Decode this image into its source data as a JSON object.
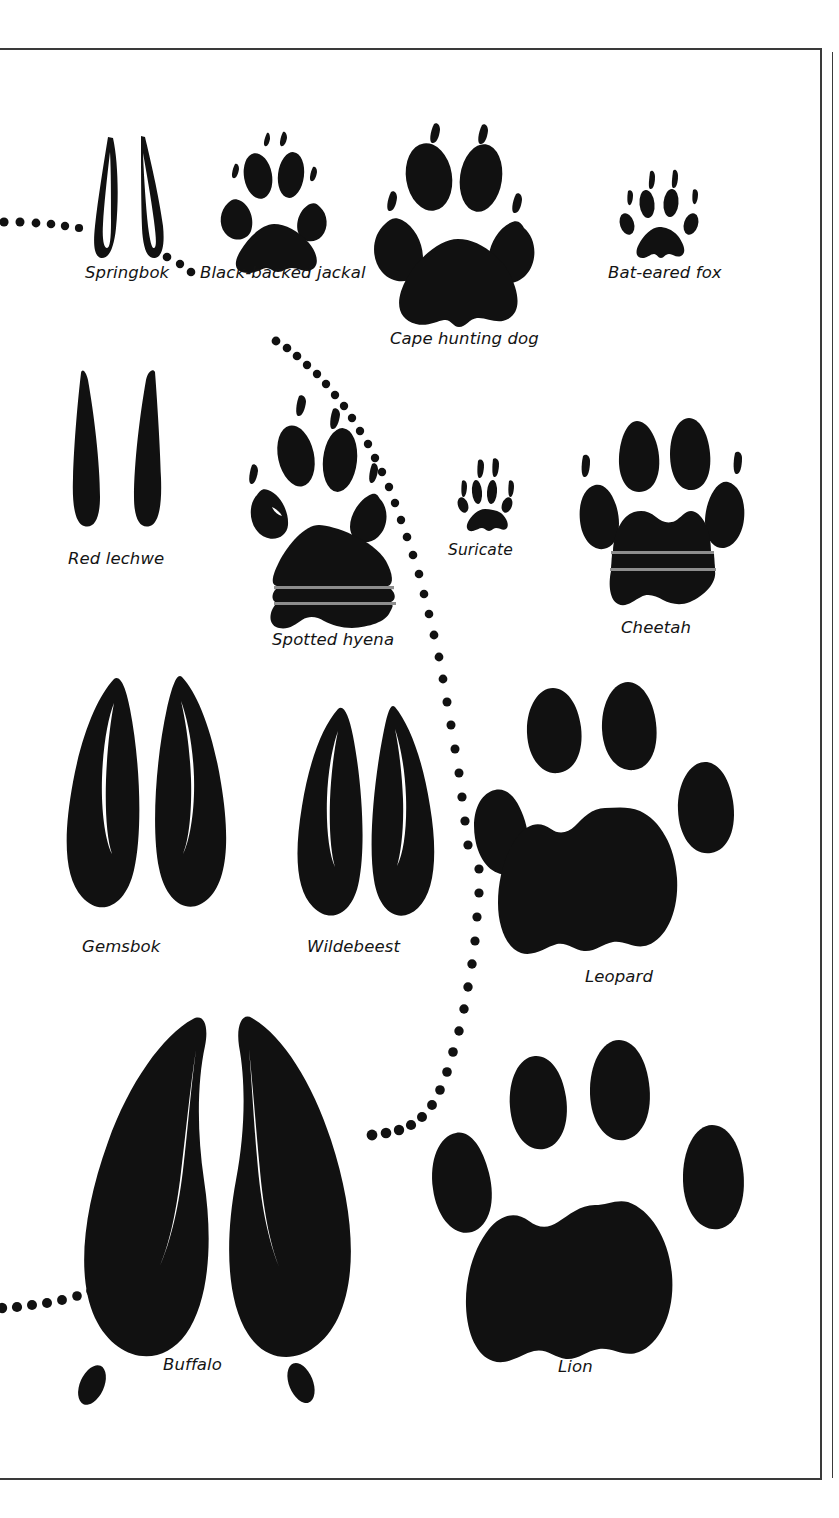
{
  "page": {
    "kind": "field-guide-plate",
    "background_color": "#ffffff",
    "ink_color": "#111111",
    "border_color": "#3a3a3a"
  },
  "tracks": [
    {
      "id": "springbok",
      "label": "Springbok",
      "type": "cloven-hoof",
      "label_x": 85,
      "label_y": 273
    },
    {
      "id": "black-backed-jackal",
      "label": "Black-backed jackal",
      "type": "paw-canid",
      "label_x": 200,
      "label_y": 273
    },
    {
      "id": "cape-hunting-dog",
      "label": "Cape hunting dog",
      "type": "paw-canid",
      "label_x": 390,
      "label_y": 339
    },
    {
      "id": "bat-eared-fox",
      "label": "Bat-eared fox",
      "type": "paw-canid",
      "label_x": 608,
      "label_y": 273
    },
    {
      "id": "red-lechwe",
      "label": "Red lechwe",
      "type": "cloven-hoof",
      "label_x": 68,
      "label_y": 559
    },
    {
      "id": "spotted-hyena",
      "label": "Spotted hyena",
      "type": "paw-canid",
      "label_x": 272,
      "label_y": 640
    },
    {
      "id": "suricate",
      "label": "Suricate",
      "type": "paw-small-mammal",
      "label_x": 448,
      "label_y": 550
    },
    {
      "id": "cheetah",
      "label": "Cheetah",
      "type": "paw-felid-clawed",
      "label_x": 621,
      "label_y": 628
    },
    {
      "id": "gemsbok",
      "label": "Gemsbok",
      "type": "cloven-hoof",
      "label_x": 82,
      "label_y": 947
    },
    {
      "id": "wildebeest",
      "label": "Wildebeest",
      "type": "cloven-hoof",
      "label_x": 307,
      "label_y": 947
    },
    {
      "id": "leopard",
      "label": "Leopard",
      "type": "paw-felid",
      "label_x": 585,
      "label_y": 977
    },
    {
      "id": "buffalo",
      "label": "Buffalo",
      "type": "cloven-hoof",
      "label_x": 163,
      "label_y": 1365
    },
    {
      "id": "lion",
      "label": "Lion",
      "type": "paw-felid",
      "label_x": 558,
      "label_y": 1367
    }
  ],
  "trails": [
    {
      "id": "trail-springbok-left",
      "description": "dotted trail entering from left edge toward Springbok"
    },
    {
      "id": "trail-springbok-right",
      "description": "dotted trail from Springbok toward Black-backed jackal"
    },
    {
      "id": "trail-main-arc",
      "description": "long dotted arc sweeping from upper-centre down past Suricate and Leopard to Buffalo"
    },
    {
      "id": "trail-buffalo-left",
      "description": "dotted trail entering from left edge toward Buffalo"
    }
  ]
}
